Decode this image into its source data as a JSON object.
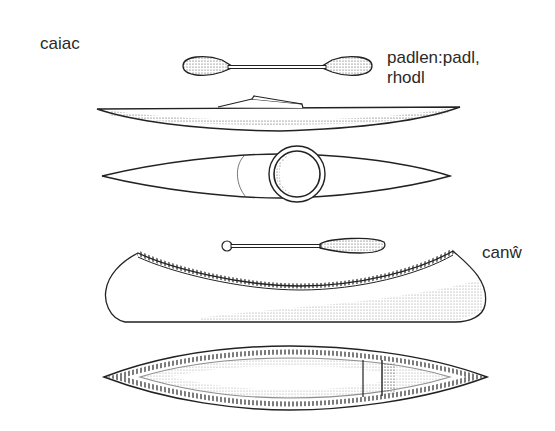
{
  "labels": {
    "kayak": "caiac",
    "paddle_line1": "padlen:padl,",
    "paddle_line2": "rhodl",
    "canoe": "canŵ"
  },
  "figures": [
    {
      "id": "kayak-paddle",
      "view": "double-bladed paddle"
    },
    {
      "id": "kayak-side",
      "view": "side view"
    },
    {
      "id": "kayak-top",
      "view": "top view with cockpit"
    },
    {
      "id": "canoe-paddle",
      "view": "single-bladed paddle"
    },
    {
      "id": "canoe-side",
      "view": "side view"
    },
    {
      "id": "canoe-top",
      "view": "top view"
    }
  ],
  "colors": {
    "ink": "#2a2a2a",
    "background": "#ffffff"
  }
}
